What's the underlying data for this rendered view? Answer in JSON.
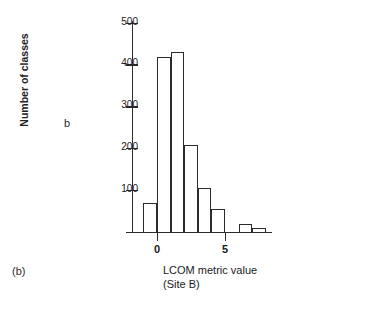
{
  "figure": {
    "panel_letter_left": "b",
    "panel_letter_bottom": "(b)",
    "xlabel_line1": "LCOM metric value",
    "xlabel_line2": "(Site B)",
    "ylabel": "Number of classes"
  },
  "chart_data": {
    "type": "bar",
    "title": "",
    "subtitle": "",
    "xlabel": "LCOM metric value (Site B)",
    "ylabel": "Number of classes",
    "xlim": [
      -1.1,
      8.5
    ],
    "ylim": [
      0,
      500
    ],
    "grid": false,
    "legend": null,
    "bar_style": "histogram-outline",
    "xtick_labels": [
      "0",
      "5"
    ],
    "xtick_values": [
      0,
      5
    ],
    "ytick_labels": [
      "100",
      "200",
      "300",
      "400",
      "500"
    ],
    "ytick_values": [
      100,
      200,
      300,
      400,
      500
    ],
    "x": [
      -0.5,
      0.5,
      1.5,
      2.5,
      3.5,
      4.5,
      6.5,
      7.5
    ],
    "categories": [
      "-0.5",
      "0.5",
      "1.5",
      "2.5",
      "3.5",
      "4.5",
      "6.5",
      "7.5"
    ],
    "values": [
      70,
      418,
      430,
      208,
      105,
      55,
      20,
      10
    ],
    "bin_width": 1,
    "colors": {
      "bar_edge": "#2b2b2b",
      "bar_fill": "#ffffff",
      "axis": "#2b2b2b",
      "text": "#1a1a1a",
      "background": "#ffffff"
    }
  }
}
